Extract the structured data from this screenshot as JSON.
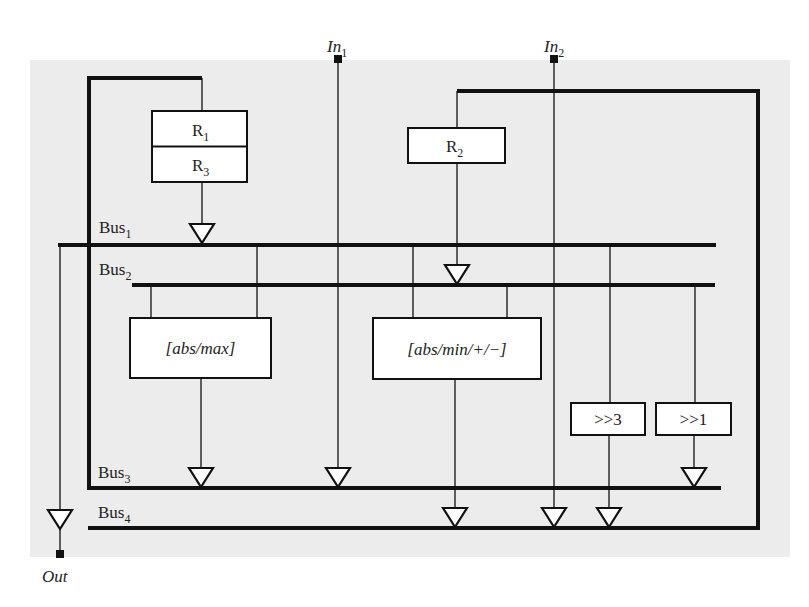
{
  "diagram": {
    "inputs": [
      {
        "id": "in1",
        "label": "In",
        "sub": "1"
      },
      {
        "id": "in2",
        "label": "In",
        "sub": "2"
      }
    ],
    "output": {
      "id": "out",
      "label": "Out"
    },
    "buses": [
      {
        "id": "bus1",
        "label": "Bus",
        "sub": "1"
      },
      {
        "id": "bus2",
        "label": "Bus",
        "sub": "2"
      },
      {
        "id": "bus3",
        "label": "Bus",
        "sub": "3"
      },
      {
        "id": "bus4",
        "label": "Bus",
        "sub": "4"
      }
    ],
    "registers": [
      {
        "id": "r1",
        "label": "R",
        "sub": "1"
      },
      {
        "id": "r3",
        "label": "R",
        "sub": "3"
      },
      {
        "id": "r2",
        "label": "R",
        "sub": "2"
      }
    ],
    "units": [
      {
        "id": "alu1",
        "label": "[abs/max]"
      },
      {
        "id": "alu2",
        "label": "[abs/min/+/−]"
      },
      {
        "id": "shift3",
        "label": ">>3"
      },
      {
        "id": "shift1",
        "label": ">>1"
      }
    ],
    "colors": {
      "background": "#ececec",
      "line": "#111111",
      "box": "#ffffff"
    }
  }
}
